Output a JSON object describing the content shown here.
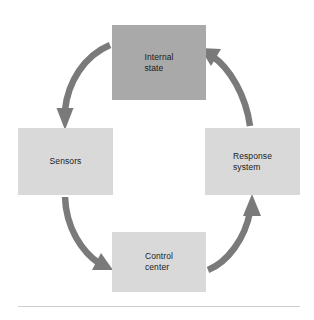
{
  "figure": {
    "kind": "cycle-diagram",
    "background_color": "#ffffff",
    "arrow_color": "#7a7a7a",
    "footer_rule_color": "#cfcfcf"
  },
  "nodes": [
    {
      "id": "internal-state",
      "label": "Internal\nstate",
      "fill": "#a9a9a9",
      "position": "top"
    },
    {
      "id": "sensors",
      "label": "Sensors",
      "fill": "#d9d9d9",
      "position": "left"
    },
    {
      "id": "response-system",
      "label": "Response\nsystem",
      "fill": "#d9d9d9",
      "position": "right"
    },
    {
      "id": "control-center",
      "label": "Control\ncenter",
      "fill": "#d9d9d9",
      "position": "bottom"
    }
  ],
  "arrows": [
    {
      "id": "internal-state-to-sensors",
      "from": "internal-state",
      "to": "sensors"
    },
    {
      "id": "sensors-to-control-center",
      "from": "sensors",
      "to": "control-center"
    },
    {
      "id": "control-center-to-response-system",
      "from": "control-center",
      "to": "response-system"
    },
    {
      "id": "response-system-to-internal-state",
      "from": "response-system",
      "to": "internal-state"
    }
  ]
}
